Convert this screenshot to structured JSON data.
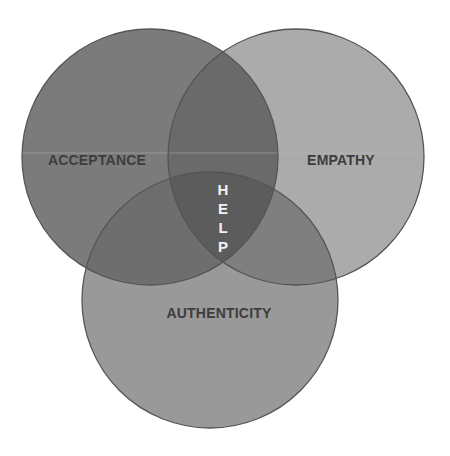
{
  "diagram": {
    "type": "venn",
    "circles": [
      {
        "id": "acceptance",
        "label": "ACCEPTANCE",
        "cx": 150,
        "cy": 157,
        "r": 128,
        "fill": "#7b7b7b"
      },
      {
        "id": "empathy",
        "label": "EMPATHY",
        "cx": 296,
        "cy": 157,
        "r": 128,
        "fill": "#ababab"
      },
      {
        "id": "authenticity",
        "label": "AUTHENTICITY",
        "cx": 210,
        "cy": 300,
        "r": 128,
        "fill": "#999999"
      }
    ],
    "intersection_label": {
      "letters": [
        "H",
        "E",
        "L",
        "P"
      ],
      "text": "HELP"
    },
    "colors": {
      "outline": "#555555",
      "overlap_ae": "#6a6a6a",
      "overlap_ab": "#6e6e6e",
      "overlap_eb": "#7f7f7f",
      "overlap_all": "#5c5c5c",
      "label_text": "#3d3d3d",
      "center_text": "#f2f2f2"
    }
  }
}
